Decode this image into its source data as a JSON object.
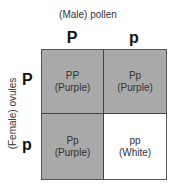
{
  "title": "(Male) pollen",
  "side_label": "(Female) ovules",
  "columns": [
    "P",
    "p"
  ],
  "rows": [
    "P",
    "p"
  ],
  "cells": [
    {
      "genotype": "PP",
      "phenotype": "(Purple)",
      "fill": "#a9a9a9"
    },
    {
      "genotype": "Pp",
      "phenotype": "(Purple)",
      "fill": "#a9a9a9"
    },
    {
      "genotype": "Pp",
      "phenotype": "(Purple)",
      "fill": "#a9a9a9"
    },
    {
      "genotype": "pp",
      "phenotype": "(White)",
      "fill": "#ffffff"
    }
  ]
}
